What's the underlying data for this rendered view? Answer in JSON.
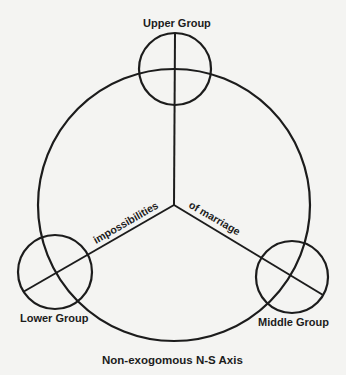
{
  "diagram": {
    "labels": {
      "upper_group": "Upper Group",
      "lower_group": "Lower Group",
      "middle_group": "Middle Group",
      "spoke_left": "impossibilities",
      "spoke_right": "of marriage",
      "axis": "Non-exogomous N-S Axis"
    },
    "colors": {
      "stroke": "#1c1c1c",
      "background": "#f4f4f2"
    },
    "geometry": {
      "main_circle": {
        "cx": 174,
        "cy": 205,
        "r": 136
      },
      "upper_circle": {
        "cx": 175,
        "cy": 69,
        "r": 36
      },
      "lower_circle": {
        "cx": 55,
        "cy": 272,
        "r": 37
      },
      "middle_circle": {
        "cx": 292,
        "cy": 277,
        "r": 36
      },
      "hub": {
        "x": 174,
        "y": 205
      }
    }
  }
}
